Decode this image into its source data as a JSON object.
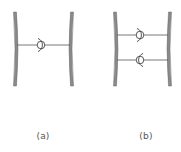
{
  "figure": {
    "type": "schematic",
    "colors": {
      "membrane": "#8a8a8a",
      "membrane_edge": "#6a6a6a",
      "linker": "#555555",
      "symbol": "#444444",
      "label": "#555555",
      "background": "#ffffff"
    }
  },
  "panels": [
    {
      "id": "a",
      "label": "(a)",
      "label_pos": {
        "x": 43,
        "y": 132
      },
      "left_membrane_x": 15,
      "right_membrane_x": 70,
      "membrane_top": 12,
      "membrane_bottom": 86,
      "linkers": [
        {
          "y": 45,
          "circle_x": 41,
          "arc_side": "right"
        }
      ]
    },
    {
      "id": "b",
      "label": "(b)",
      "label_pos": {
        "x": 146,
        "y": 132
      },
      "left_membrane_x": 115,
      "right_membrane_x": 168,
      "membrane_top": 12,
      "membrane_bottom": 86,
      "linkers": [
        {
          "y": 35,
          "circle_x": 140,
          "arc_side": "right"
        },
        {
          "y": 60,
          "circle_x": 140,
          "arc_side": "left"
        }
      ]
    }
  ]
}
